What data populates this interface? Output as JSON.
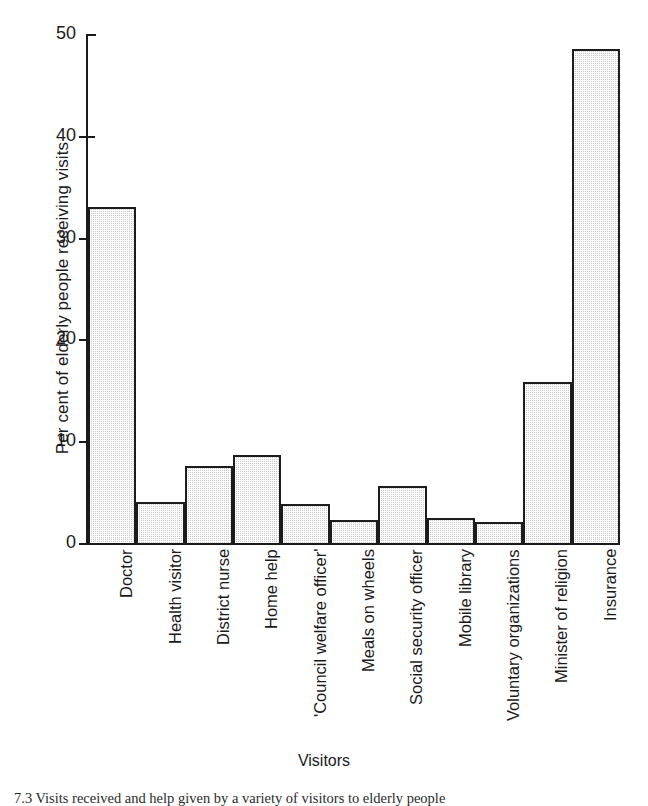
{
  "chart_data": {
    "type": "bar",
    "title": "",
    "xlabel": "Visitors",
    "ylabel": "Per cent of elderly people receiving visits",
    "ylim": [
      0,
      50
    ],
    "yticks": [
      0,
      10,
      20,
      30,
      40,
      50
    ],
    "grid": false,
    "legend": null,
    "categories": [
      "Doctor",
      "Health visitor",
      "District nurse",
      "Home help",
      "'Council welfare officer'",
      "Meals on wheels",
      "Social security officer",
      "Mobile library",
      "Voluntary organizations",
      "Minister of religion",
      "Insurance"
    ],
    "values": [
      33.0,
      4.0,
      7.6,
      8.6,
      3.8,
      2.3,
      5.6,
      2.5,
      2.1,
      15.8,
      48.5
    ]
  },
  "axes": {
    "y_title": "Per cent of elderly people receiving visits",
    "x_title": "Visitors",
    "y_tick_labels": [
      "0",
      "10",
      "20",
      "30",
      "40",
      "50"
    ]
  },
  "caption": {
    "text": "7.3 Visits received and help given by a variety of visitors to elderly people"
  },
  "style": {
    "bar_fill": "#c9c9c9",
    "bar_outline": "#1c1c1c",
    "axis_color": "#1a1a1a",
    "background": "#ffffff"
  }
}
